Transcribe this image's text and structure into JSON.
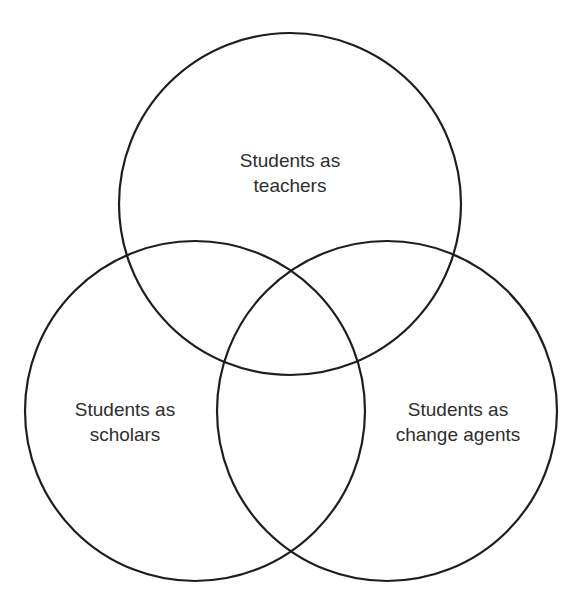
{
  "diagram": {
    "type": "venn",
    "stroke_color": "#1e1e1e",
    "text_color": "#2e2e2e",
    "background": "#ffffff",
    "circles": [
      {
        "id": "teachers",
        "cx": 290,
        "cy": 204,
        "r": 171,
        "label_lines": [
          "Students as",
          "teachers"
        ],
        "label_x": 290,
        "label_y": 148
      },
      {
        "id": "scholars",
        "cx": 195,
        "cy": 411,
        "r": 170,
        "label_lines": [
          "Students as",
          "scholars"
        ],
        "label_x": 125,
        "label_y": 397
      },
      {
        "id": "change-agents",
        "cx": 387,
        "cy": 411,
        "r": 170,
        "label_lines": [
          "Students as",
          "change agents"
        ],
        "label_x": 458,
        "label_y": 397
      }
    ]
  }
}
